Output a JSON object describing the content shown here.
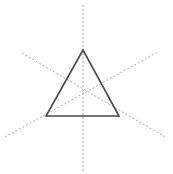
{
  "figure": {
    "background_color": "#ffffff",
    "width": 173,
    "height": 174
  },
  "chart_data": {
    "type": "diagram",
    "xlabel": "",
    "ylabel": "",
    "grid": false,
    "legend": "none",
    "xlim": [
      0,
      173
    ],
    "ylim": [
      0,
      174
    ],
    "center_point": {
      "x": 83,
      "y": 95
    },
    "shapes": [
      {
        "name": "triangle",
        "kind": "polygon",
        "closed": true,
        "stroke": "#4a4a4a",
        "stroke_width": 1.6,
        "fill": "none",
        "points": [
          {
            "label": "apex",
            "x": 83,
            "y": 50
          },
          {
            "label": "bottom-right",
            "x": 119,
            "y": 116
          },
          {
            "label": "bottom-left",
            "x": 46,
            "y": 116
          }
        ]
      }
    ],
    "axes_of_symmetry": [
      {
        "name": "vertical-axis",
        "kind": "line",
        "angle_degrees": 90,
        "stroke": "#a8a8a8",
        "stroke_width": 1,
        "dash": "2 2",
        "x1": 83,
        "y1": 5,
        "x2": 83,
        "y2": 172
      },
      {
        "name": "diagonal-axis-down-right",
        "kind": "line",
        "angle_degrees": -30,
        "stroke": "#a8a8a8",
        "stroke_width": 1,
        "dash": "2 2",
        "x1": 22,
        "y1": 53,
        "x2": 165,
        "y2": 137
      },
      {
        "name": "diagonal-axis-up-right",
        "kind": "line",
        "angle_degrees": 30,
        "stroke": "#a8a8a8",
        "stroke_width": 1,
        "dash": "2 2",
        "x1": 5,
        "y1": 137,
        "x2": 158,
        "y2": 52
      }
    ],
    "annotations": []
  }
}
